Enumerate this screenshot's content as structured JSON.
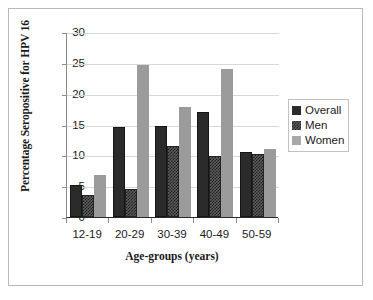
{
  "chart_data": {
    "type": "bar",
    "title": "",
    "xlabel": "Age-groups (years)",
    "ylabel": "Percentage Seropositive for HPV 16",
    "categories": [
      "12-19",
      "20-29",
      "30-39",
      "40-49",
      "50-59"
    ],
    "series": [
      {
        "name": "Overall",
        "values": [
          5.2,
          14.6,
          14.7,
          17.0,
          10.6
        ],
        "color": "#2b2b2b",
        "pattern": "solid"
      },
      {
        "name": "Men",
        "values": [
          3.5,
          4.5,
          11.5,
          9.9,
          10.2
        ],
        "color": "#5d5d5d",
        "pattern": "checkerboard"
      },
      {
        "name": "Women",
        "values": [
          6.8,
          24.7,
          17.8,
          24.0,
          11.0
        ],
        "color": "#9b9b9b",
        "pattern": "solid"
      }
    ],
    "ylim": [
      0,
      30
    ],
    "yticks": [
      0,
      5,
      10,
      15,
      20,
      25,
      30
    ],
    "ytick_labels": [
      "0",
      "5",
      "10",
      "15",
      "20",
      "25",
      "30"
    ],
    "grid": true,
    "grid_axis": "y",
    "legend_position": "right",
    "legend_entries": [
      "Overall",
      "Men",
      "Women"
    ]
  },
  "axes": {
    "y_title": "Percentage Seropositive for HPV 16",
    "x_title": "Age-groups (years)"
  }
}
